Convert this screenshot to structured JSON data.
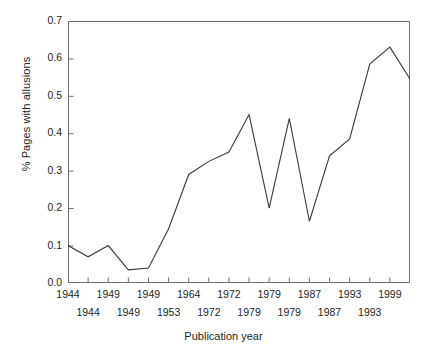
{
  "chart_data": {
    "type": "line",
    "title": "",
    "xlabel": "Publication year",
    "ylabel": "% Pages with allusions",
    "ylim": [
      0.0,
      0.7
    ],
    "ytick_labels": [
      "0.7",
      "0.6",
      "0.5",
      "0.4",
      "0.3",
      "0.2",
      "0.1",
      "0.0"
    ],
    "ytick_values": [
      0.7,
      0.6,
      0.5,
      0.4,
      0.3,
      0.2,
      0.1,
      0.0
    ],
    "grid": false,
    "legend": null,
    "xtick_labels_row1": [
      "1944",
      "1949",
      "1949",
      "1964",
      "1972",
      "1979",
      "1987",
      "1993",
      "1999"
    ],
    "xtick_labels_row2": [
      "1944",
      "1949",
      "1953",
      "1972",
      "1979",
      "1979",
      "1987",
      "1993"
    ],
    "x_index": [
      0,
      1,
      2,
      3,
      4,
      5,
      6,
      7,
      8,
      9,
      10,
      11,
      12,
      13,
      14,
      15,
      16,
      17
    ],
    "values": [
      0.1,
      0.07,
      0.1,
      0.035,
      0.04,
      0.145,
      0.29,
      0.325,
      0.35,
      0.45,
      0.2,
      0.44,
      0.165,
      0.34,
      0.385,
      0.585,
      0.63,
      0.545
    ],
    "series": [
      {
        "name": "% Pages with allusions",
        "values": [
          0.1,
          0.07,
          0.1,
          0.035,
          0.04,
          0.145,
          0.29,
          0.325,
          0.35,
          0.45,
          0.2,
          0.44,
          0.165,
          0.34,
          0.385,
          0.585,
          0.63,
          0.545
        ],
        "color": "#3a3a3a"
      }
    ]
  },
  "axes": {
    "line_color": "#3a3a3a",
    "frame_color": "#6e6e6e"
  }
}
